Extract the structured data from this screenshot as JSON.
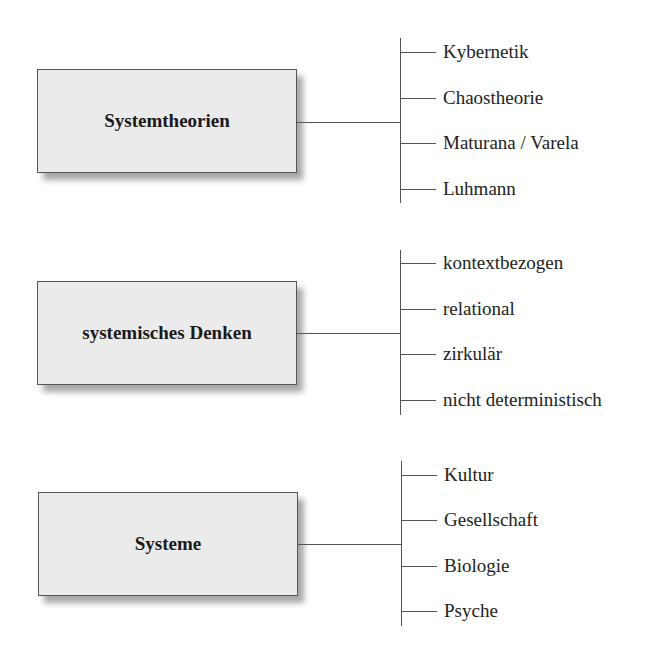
{
  "groups": [
    {
      "title": "Systemtheorien",
      "items": [
        "Kybernetik",
        "Chaostheorie",
        "Maturana / Varela",
        "Luhmann"
      ]
    },
    {
      "title": "systemisches Denken",
      "items": [
        "kontextbezogen",
        "relational",
        "zirkulär",
        "nicht deterministisch"
      ]
    },
    {
      "title": "Systeme",
      "items": [
        "Kultur",
        "Gesellschaft",
        "Biologie",
        "Psyche"
      ]
    }
  ],
  "colors": {
    "box_fill": "#ebebeb",
    "line": "#555555",
    "text": "#222222"
  }
}
